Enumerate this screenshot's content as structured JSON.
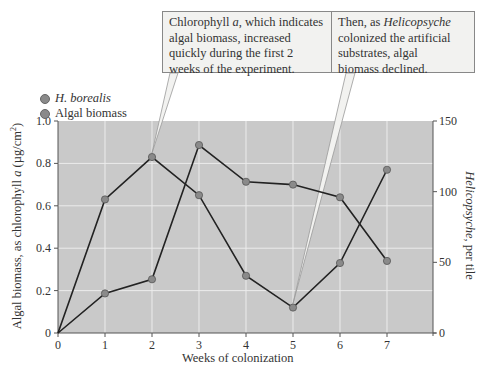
{
  "chart_data": {
    "type": "line",
    "title": "",
    "xlabel": "Weeks of colonization",
    "ylabel_left": "Algal biomass, as chlorophyll a (µg/cm²)",
    "ylabel_right": "Helicopsyche, per tile",
    "x": [
      0,
      1,
      2,
      3,
      4,
      5,
      6,
      7
    ],
    "xticks": [
      "0",
      "1",
      "2",
      "3",
      "4",
      "5",
      "6",
      "7"
    ],
    "yticks_left": [
      "0",
      "0.2",
      "0.4",
      "0.6",
      "0.8",
      "1.0"
    ],
    "yticks_right": [
      "0",
      "50",
      "100",
      "150"
    ],
    "ylim_left": [
      0,
      1.0
    ],
    "ylim_right": [
      0,
      150
    ],
    "grid": true,
    "legend_position": "top-left",
    "series": [
      {
        "name": "H. borealis",
        "axis": "right",
        "values": [
          0,
          28,
          38,
          133,
          107,
          105,
          96,
          51
        ]
      },
      {
        "name": "Algal biomass",
        "axis": "left",
        "values": [
          0,
          0.63,
          0.83,
          0.65,
          0.27,
          0.12,
          0.33,
          0.77
        ]
      }
    ],
    "annotations": [
      {
        "text": "Chlorophyll a, which indicates algal biomass, increased quickly during the first 2 weeks of the experiment.",
        "points_to": {
          "x": 2,
          "series": "Algal biomass"
        }
      },
      {
        "text": "Then, as Helicopsyche colonized the artificial substrates, algal biomass declined.",
        "points_to": {
          "x": 5,
          "series": "Algal biomass"
        }
      }
    ]
  },
  "legend": {
    "item1": "H. borealis",
    "item2": "Algal biomass"
  },
  "callouts": {
    "left_line1_a": "Chlorophyll ",
    "left_line1_i": "a",
    "left_line1_b": ", which indicates",
    "left_line2": "algal biomass, increased",
    "left_line3": "quickly during the first 2",
    "left_line4": "weeks of the experiment.",
    "right_line1_a": "Then, as ",
    "right_line1_i": "Helicopsyche",
    "right_line2": "colonized the artificial",
    "right_line3": "substrates, algal",
    "right_line4": "biomass declined."
  },
  "axes": {
    "xlabel": "Weeks of colonization",
    "ylabel_left_a": "Algal biomass, as chlorophyll ",
    "ylabel_left_i": "a",
    "ylabel_left_b": " (µg/cm",
    "ylabel_left_sup": "2",
    "ylabel_left_c": ")",
    "ylabel_right_i": "Helicopsyche",
    "ylabel_right_b": ", per tile"
  },
  "colors": {
    "plot_bg": "#c9c9c9",
    "grid": "#ececec",
    "line": "#222222",
    "marker": "#8a8a8a",
    "callout_bg": "#f2f2f0"
  }
}
